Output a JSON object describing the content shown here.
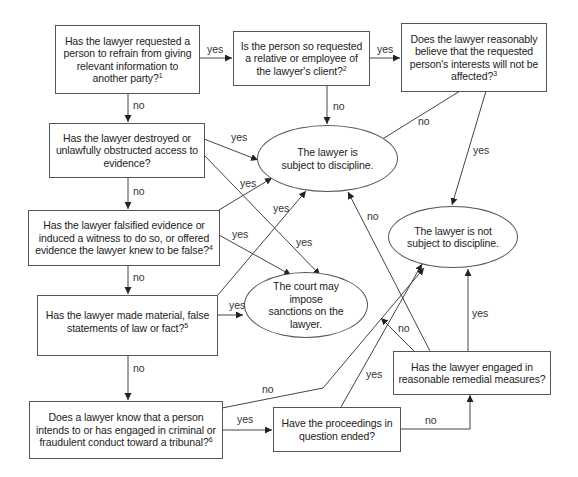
{
  "diagram": {
    "nodes": {
      "q_refrain": {
        "text": "Has the lawyer requested a person to refrain from giving relevant information to another party?",
        "footnote": "1"
      },
      "q_relative": {
        "text": "Is the person so requested a relative or employee of the lawyer's client?",
        "footnote": "2"
      },
      "q_interests": {
        "text": "Does the lawyer reasonably believe that the requested person's interests will not be affected?",
        "footnote": "3"
      },
      "q_destroyed": {
        "text": "Has the lawyer destroyed or unlawfully obstructed access to evidence?",
        "footnote": ""
      },
      "q_falsified": {
        "text": "Has the lawyer falsified evidence or induced a witness to do so, or offered evidence the lawyer knew to be false?",
        "footnote": "4"
      },
      "q_statements": {
        "text": "Has the lawyer made material, false statements of law or fact?",
        "footnote": "5"
      },
      "q_criminal": {
        "text": "Does a lawyer know that a person intends to or has engaged in criminal or fraudulent conduct toward a tribunal?",
        "footnote": "6"
      },
      "q_ended": {
        "text": "Have the proceedings in question ended?",
        "footnote": ""
      },
      "q_remedial": {
        "text": "Has the lawyer engaged in reasonable remedial measures?",
        "footnote": ""
      },
      "o_subject": {
        "text": "The lawyer is subject to discipline."
      },
      "o_not_subject": {
        "text": "The lawyer is not subject to discipline."
      },
      "o_sanctions": {
        "text": "The court may impose sanctions on the lawyer."
      }
    },
    "edge_labels": {
      "yes": "yes",
      "no": "no"
    },
    "edges": [
      {
        "from": "q_refrain",
        "to": "q_relative",
        "label": "yes"
      },
      {
        "from": "q_refrain",
        "to": "q_destroyed",
        "label": "no"
      },
      {
        "from": "q_relative",
        "to": "q_interests",
        "label": "yes"
      },
      {
        "from": "q_relative",
        "to": "o_subject",
        "label": "no"
      },
      {
        "from": "q_interests",
        "to": "o_subject",
        "label": "no"
      },
      {
        "from": "q_interests",
        "to": "o_not_subject",
        "label": "yes"
      },
      {
        "from": "q_destroyed",
        "to": "o_subject",
        "label": "yes"
      },
      {
        "from": "q_destroyed",
        "to": "o_sanctions",
        "label": "yes"
      },
      {
        "from": "q_destroyed",
        "to": "q_falsified",
        "label": "no"
      },
      {
        "from": "q_falsified",
        "to": "o_subject",
        "label": "yes"
      },
      {
        "from": "q_falsified",
        "to": "o_sanctions",
        "label": "yes"
      },
      {
        "from": "q_falsified",
        "to": "q_statements",
        "label": "no"
      },
      {
        "from": "q_statements",
        "to": "o_subject",
        "label": "yes"
      },
      {
        "from": "q_statements",
        "to": "o_sanctions",
        "label": "yes"
      },
      {
        "from": "q_statements",
        "to": "q_criminal",
        "label": "no"
      },
      {
        "from": "q_criminal",
        "to": "q_ended",
        "label": "yes"
      },
      {
        "from": "q_criminal",
        "to": "o_not_subject",
        "label": "no"
      },
      {
        "from": "q_ended",
        "to": "o_not_subject",
        "label": "yes"
      },
      {
        "from": "q_ended",
        "to": "q_remedial",
        "label": "no"
      },
      {
        "from": "q_remedial",
        "to": "o_not_subject",
        "label": "yes"
      },
      {
        "from": "q_remedial",
        "to": "o_subject",
        "label": "no"
      },
      {
        "from": "q_remedial",
        "to": "o_sanctions",
        "label": "no"
      }
    ]
  }
}
